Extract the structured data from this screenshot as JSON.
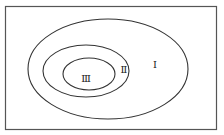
{
  "diagram": {
    "type": "nested-sets",
    "regions": [
      {
        "id": "outer",
        "label": "Ⅰ"
      },
      {
        "id": "middle",
        "label": "Ⅱ"
      },
      {
        "id": "inner",
        "label": "Ⅲ"
      }
    ],
    "colors": {
      "stroke": "#333333",
      "frame": "#555555",
      "background": "#ffffff"
    }
  }
}
